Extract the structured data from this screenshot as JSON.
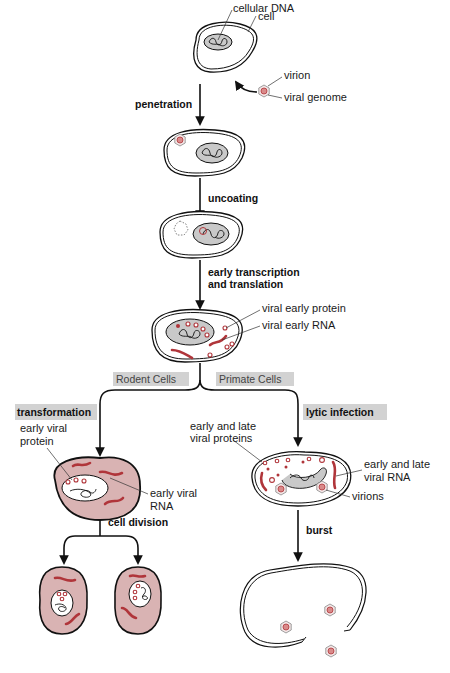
{
  "diagram": {
    "type": "process-flow",
    "stage1_labels": {
      "cellular_dna": "cellular DNA",
      "cell": "cell",
      "virion": "virion",
      "viral_genome": "viral genome"
    },
    "steps": {
      "penetration": "penetration",
      "uncoating": "uncoating",
      "early_transcription_line1": "early transcription",
      "early_transcription_line2": "and translation",
      "cell_division": "cell division",
      "burst": "burst"
    },
    "stage4_labels": {
      "viral_early_protein": "viral early protein",
      "viral_early_rna": "viral early RNA"
    },
    "branches": {
      "rodent": "Rodent Cells",
      "primate": "Primate Cells"
    },
    "outcomes": {
      "transformation": "transformation",
      "lytic": "lytic infection"
    },
    "transformation_labels": {
      "early_viral_protein_line1": "early viral",
      "early_viral_protein_line2": "protein",
      "early_viral_rna_line1": "early viral",
      "early_viral_rna_line2": "RNA"
    },
    "lytic_labels": {
      "proteins_line1": "early and late",
      "proteins_line2": "viral proteins",
      "rna_line1": "early and late",
      "rna_line2": "viral RNA",
      "virions": "virions"
    },
    "colors": {
      "viral_rna": "#b0353a",
      "transformed_cytoplasm": "#d9b3b3",
      "nucleus": "#c9c9c9",
      "label_box": "#d2d2d2"
    }
  }
}
